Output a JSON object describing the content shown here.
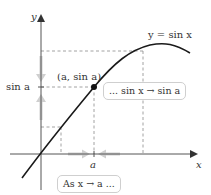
{
  "diagram": {
    "axes": {
      "x_label": "x",
      "y_label": "y"
    },
    "curve_label": "y = sin x",
    "point_label": "(a, sin a)",
    "y_tick_label": "sin a",
    "x_tick_label": "a",
    "callout_top": "... sin x → sin a",
    "callout_bottom": "As x → a ...",
    "colors": {
      "curve": "#1a1a1a",
      "axis": "#555555",
      "dashed": "#8a8a8a",
      "arrow_shade": "#c8c8c8",
      "callout_border": "#cfcfcf"
    }
  }
}
